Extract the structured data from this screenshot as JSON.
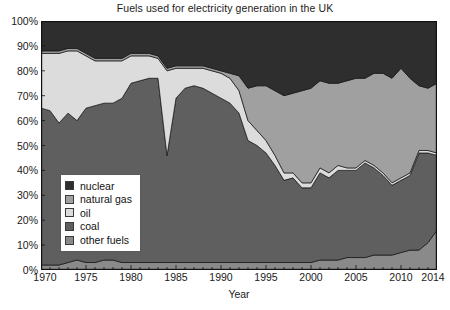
{
  "chart_data": {
    "type": "area",
    "stacked": true,
    "title": "Fuels used for electricity generation in the UK",
    "xlabel": "Year",
    "ylabel": "",
    "xlim": [
      1970,
      2014
    ],
    "ylim": [
      0,
      100
    ],
    "y_unit": "%",
    "grid": false,
    "legend_position": "inside-lower-left",
    "x_tick_labels": [
      "1970",
      "1975",
      "1980",
      "1985",
      "1990",
      "1995",
      "2000",
      "2005",
      "2010",
      "2014"
    ],
    "x_tick_values": [
      1970,
      1975,
      1980,
      1985,
      1990,
      1995,
      2000,
      2005,
      2010,
      2014
    ],
    "x_minor_tick_step": 1,
    "y_tick_labels": [
      "0%",
      "10%",
      "20%",
      "30%",
      "40%",
      "50%",
      "60%",
      "70%",
      "80%",
      "90%",
      "100%"
    ],
    "y_tick_values": [
      0,
      10,
      20,
      30,
      40,
      50,
      60,
      70,
      80,
      90,
      100
    ],
    "x": [
      1970,
      1971,
      1972,
      1973,
      1974,
      1975,
      1976,
      1977,
      1978,
      1979,
      1980,
      1981,
      1982,
      1983,
      1984,
      1985,
      1986,
      1987,
      1988,
      1989,
      1990,
      1991,
      1992,
      1993,
      1994,
      1995,
      1996,
      1997,
      1998,
      1999,
      2000,
      2001,
      2002,
      2003,
      2004,
      2005,
      2006,
      2007,
      2008,
      2009,
      2010,
      2011,
      2012,
      2013,
      2014
    ],
    "stack_order_bottom_to_top": [
      "other fuels",
      "coal",
      "oil",
      "natural gas",
      "nuclear"
    ],
    "series": [
      {
        "name": "other fuels",
        "color": "#8a8a8a",
        "values": [
          2,
          2,
          2,
          3,
          4,
          3,
          3,
          4,
          4,
          3,
          3,
          3,
          3,
          3,
          3,
          3,
          3,
          3,
          3,
          3,
          3,
          3,
          3,
          3,
          3,
          3,
          3,
          3,
          3,
          3,
          3,
          4,
          4,
          4,
          5,
          5,
          5,
          6,
          6,
          6,
          7,
          8,
          8,
          11,
          16
        ]
      },
      {
        "name": "coal",
        "color": "#5f5f5f",
        "values": [
          63,
          62,
          57,
          60,
          56,
          62,
          63,
          63,
          63,
          66,
          72,
          73,
          74,
          74,
          43,
          66,
          70,
          71,
          70,
          68,
          66,
          64,
          60,
          49,
          47,
          44,
          39,
          33,
          34,
          30,
          30,
          35,
          33,
          36,
          35,
          35,
          38,
          35,
          32,
          28,
          29,
          30,
          39,
          36,
          30
        ]
      },
      {
        "name": "oil",
        "color": "#dcdcdc",
        "values": [
          22,
          23,
          28,
          25,
          28,
          21,
          18,
          17,
          17,
          15,
          11,
          10,
          9,
          8,
          34,
          12,
          8,
          7,
          8,
          9,
          10,
          10,
          9,
          8,
          6,
          5,
          4,
          3,
          2,
          2,
          2,
          2,
          2,
          2,
          1,
          1,
          1,
          1,
          1,
          1,
          1,
          1,
          1,
          1,
          1
        ]
      },
      {
        "name": "natural gas",
        "color": "#a0a0a0",
        "values": [
          1,
          1,
          1,
          1,
          1,
          1,
          1,
          1,
          1,
          1,
          1,
          1,
          1,
          1,
          1,
          1,
          1,
          1,
          1,
          1,
          1,
          2,
          6,
          13,
          18,
          22,
          26,
          31,
          32,
          37,
          38,
          35,
          36,
          33,
          35,
          36,
          33,
          37,
          40,
          42,
          44,
          38,
          26,
          25,
          28
        ]
      },
      {
        "name": "nuclear",
        "color": "#2e2e2e",
        "values": [
          12,
          12,
          12,
          11,
          11,
          13,
          15,
          15,
          15,
          15,
          13,
          13,
          13,
          14,
          19,
          18,
          18,
          18,
          18,
          19,
          20,
          21,
          22,
          27,
          26,
          26,
          28,
          30,
          29,
          28,
          27,
          24,
          25,
          25,
          24,
          23,
          23,
          21,
          21,
          23,
          19,
          23,
          26,
          27,
          25
        ]
      }
    ]
  },
  "legend": {
    "items": [
      {
        "label": "nuclear",
        "color": "#2e2e2e"
      },
      {
        "label": "natural gas",
        "color": "#a0a0a0"
      },
      {
        "label": "oil",
        "color": "#dcdcdc"
      },
      {
        "label": "coal",
        "color": "#5f5f5f"
      },
      {
        "label": "other fuels",
        "color": "#8a8a8a"
      }
    ]
  },
  "axes": {
    "frame_color": "#111111"
  }
}
